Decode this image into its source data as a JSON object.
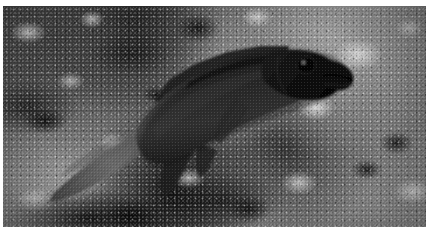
{
  "image": {
    "kind": "photograph",
    "medium": "underwater-photograph",
    "color_mode": "grayscale",
    "orientation": "landscape",
    "width_px": 429,
    "height_px": 235,
    "border": {
      "color": "#ffffff",
      "top_px": 6,
      "bottom_px": 8,
      "left_px": 3,
      "right_px": 3
    },
    "caption": "Black and white underwater photograph of a dark-bodied reef fish swimming right across a mottled coral rubble seabed"
  },
  "subject": {
    "name": "reef-fish",
    "label": "Dark reef fish",
    "facing": "right",
    "body_tone": "#2a2a2a",
    "highlight_tone": "#6f6f6f",
    "parts": [
      {
        "name": "tail-fin",
        "label": "Caudal fin",
        "tone": "#555555"
      },
      {
        "name": "body",
        "label": "Body",
        "tone": "#262626"
      },
      {
        "name": "dorsal-fin",
        "label": "Dorsal fin",
        "tone": "#1e1e1e"
      },
      {
        "name": "anal-fin",
        "label": "Anal fin",
        "tone": "#1c1c1c"
      },
      {
        "name": "pectoral-fin",
        "label": "Pectoral fin",
        "tone": "#333333"
      },
      {
        "name": "head",
        "label": "Head",
        "tone": "#141414"
      },
      {
        "name": "eye",
        "label": "Eye",
        "tone": "#0a0a0a"
      },
      {
        "name": "mouth",
        "label": "Mouth",
        "tone": "#050505"
      },
      {
        "name": "scale-texture",
        "label": "Scale speckle pattern",
        "tone": "#4a4a4a"
      }
    ]
  },
  "background": {
    "name": "coral-reef-floor",
    "label": "Mottled coral rubble and rock seabed",
    "tones": {
      "light": "#d6d6d6",
      "mid": "#7a7a7a",
      "dark": "#101010",
      "base": "#5d5d5d"
    }
  }
}
